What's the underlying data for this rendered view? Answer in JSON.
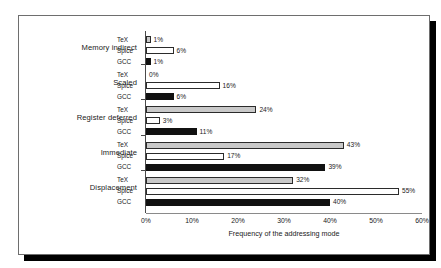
{
  "chart_data": {
    "type": "bar",
    "orientation": "horizontal",
    "title": "",
    "xlabel": "Frequency of the addressing mode",
    "ylabel": "",
    "xlim": [
      0,
      60
    ],
    "xunit": "%",
    "grid": false,
    "legend": "none",
    "xticks": [
      "0%",
      "10%",
      "20%",
      "30%",
      "40%",
      "50%",
      "60%"
    ],
    "xtick_values": [
      0,
      10,
      20,
      30,
      40,
      50,
      60
    ],
    "categories": [
      "Memory indirect",
      "Scaled",
      "Register deferred",
      "Immediate",
      "Displacement"
    ],
    "series": [
      {
        "name": "TeX",
        "fill": "#c9c9c9",
        "values": [
          1,
          0,
          24,
          43,
          32
        ],
        "labels": [
          "1%",
          "0%",
          "24%",
          "43%",
          "32%"
        ]
      },
      {
        "name": "Spice",
        "fill": "#ffffff",
        "values": [
          6,
          16,
          3,
          17,
          55
        ],
        "labels": [
          "6%",
          "16%",
          "3%",
          "17%",
          "55%"
        ]
      },
      {
        "name": "GCC",
        "fill": "#111111",
        "values": [
          1,
          6,
          11,
          39,
          40
        ],
        "labels": [
          "1%",
          "6%",
          "11%",
          "39%",
          "40%"
        ]
      }
    ]
  },
  "figure": {
    "frame_color": "#6e6e6e",
    "shadow_color": "#000000",
    "background": "#ffffff"
  }
}
